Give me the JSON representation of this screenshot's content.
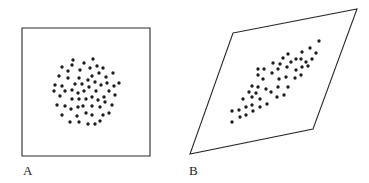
{
  "panels": [
    {
      "label": "A",
      "shape": "square",
      "outline": [
        [
          22,
          28
        ],
        [
          150,
          28
        ],
        [
          150,
          156
        ],
        [
          22,
          156
        ]
      ],
      "dots": [
        [
          73,
          60
        ],
        [
          93,
          59
        ],
        [
          84,
          63
        ],
        [
          62,
          67
        ],
        [
          72,
          65
        ],
        [
          90,
          68
        ],
        [
          97,
          66
        ],
        [
          103,
          68
        ],
        [
          68,
          71
        ],
        [
          80,
          70
        ],
        [
          113,
          73
        ],
        [
          59,
          76
        ],
        [
          68,
          78
        ],
        [
          79,
          78
        ],
        [
          92,
          76
        ],
        [
          99,
          73
        ],
        [
          106,
          77
        ],
        [
          55,
          85
        ],
        [
          62,
          86
        ],
        [
          75,
          84
        ],
        [
          82,
          84
        ],
        [
          88,
          80
        ],
        [
          95,
          82
        ],
        [
          101,
          85
        ],
        [
          107,
          83
        ],
        [
          114,
          86
        ],
        [
          119,
          83
        ],
        [
          54,
          91
        ],
        [
          65,
          91
        ],
        [
          72,
          90
        ],
        [
          78,
          93
        ],
        [
          84,
          91
        ],
        [
          89,
          87
        ],
        [
          96,
          91
        ],
        [
          109,
          91
        ],
        [
          115,
          95
        ],
        [
          60,
          96
        ],
        [
          72,
          99
        ],
        [
          79,
          99
        ],
        [
          86,
          99
        ],
        [
          92,
          97
        ],
        [
          98,
          100
        ],
        [
          104,
          97
        ],
        [
          57,
          105
        ],
        [
          65,
          106
        ],
        [
          71,
          109
        ],
        [
          78,
          107
        ],
        [
          83,
          106
        ],
        [
          92,
          106
        ],
        [
          100,
          107
        ],
        [
          105,
          102
        ],
        [
          112,
          105
        ],
        [
          62,
          115
        ],
        [
          77,
          116
        ],
        [
          86,
          113
        ],
        [
          92,
          115
        ],
        [
          103,
          115
        ],
        [
          109,
          113
        ],
        [
          70,
          122
        ],
        [
          79,
          122
        ],
        [
          88,
          124
        ],
        [
          95,
          124
        ],
        [
          100,
          121
        ]
      ]
    },
    {
      "label": "B",
      "shape": "parallelogram",
      "outline": [
        [
          233,
          33
        ],
        [
          357,
          9
        ],
        [
          313,
          129
        ],
        [
          190,
          154
        ]
      ],
      "dots": [
        [
          319,
          41
        ],
        [
          310,
          48
        ],
        [
          302,
          52
        ],
        [
          288,
          54
        ],
        [
          283,
          58
        ],
        [
          291,
          62
        ],
        [
          296,
          59
        ],
        [
          301,
          59
        ],
        [
          306,
          62
        ],
        [
          312,
          59
        ],
        [
          316,
          53
        ],
        [
          308,
          66
        ],
        [
          302,
          67
        ],
        [
          296,
          70
        ],
        [
          287,
          67
        ],
        [
          280,
          64
        ],
        [
          273,
          63
        ],
        [
          278,
          69
        ],
        [
          272,
          73
        ],
        [
          264,
          69
        ],
        [
          258,
          69
        ],
        [
          258,
          75
        ],
        [
          263,
          79
        ],
        [
          279,
          79
        ],
        [
          286,
          77
        ],
        [
          295,
          78
        ],
        [
          301,
          75
        ],
        [
          278,
          87
        ],
        [
          288,
          87
        ],
        [
          252,
          86
        ],
        [
          258,
          87
        ],
        [
          266,
          89
        ],
        [
          271,
          92
        ],
        [
          277,
          97
        ],
        [
          284,
          95
        ],
        [
          249,
          92
        ],
        [
          256,
          93
        ],
        [
          252,
          97
        ],
        [
          243,
          99
        ],
        [
          260,
          99
        ],
        [
          267,
          104
        ],
        [
          260,
          107
        ],
        [
          252,
          105
        ],
        [
          246,
          107
        ],
        [
          239,
          110
        ],
        [
          232,
          111
        ],
        [
          253,
          111
        ],
        [
          246,
          115
        ],
        [
          240,
          117
        ],
        [
          232,
          122
        ]
      ]
    }
  ],
  "labels": {
    "a": "A",
    "b": "B"
  },
  "colors": {
    "stroke": "#2a2a2a",
    "dot": "#1e1e1e"
  }
}
